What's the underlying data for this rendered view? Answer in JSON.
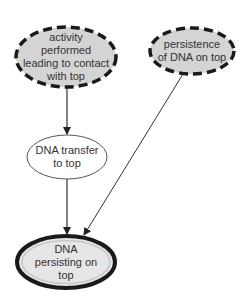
{
  "diagram": {
    "type": "bayesian-network",
    "nodes": [
      {
        "id": "activity",
        "label": "activity\nperformed\nleading to contact\nwith top",
        "style": "dashed",
        "fill": "#d4d4d4",
        "stroke": "#1a1a1a"
      },
      {
        "id": "persistence",
        "label": "persistence\nof DNA on top",
        "style": "dashed",
        "fill": "#d4d4d4",
        "stroke": "#1a1a1a"
      },
      {
        "id": "transfer",
        "label": "DNA transfer\nto top",
        "style": "solid-thin",
        "fill": "#ffffff",
        "stroke": "#555555"
      },
      {
        "id": "persisting",
        "label": "DNA\npersisting on\ntop",
        "style": "double-thick",
        "fill": "#e6e6e6",
        "stroke": "#1a1a1a"
      }
    ],
    "edges": [
      {
        "from": "activity",
        "to": "transfer"
      },
      {
        "from": "transfer",
        "to": "persisting"
      },
      {
        "from": "persistence",
        "to": "persisting"
      }
    ]
  }
}
